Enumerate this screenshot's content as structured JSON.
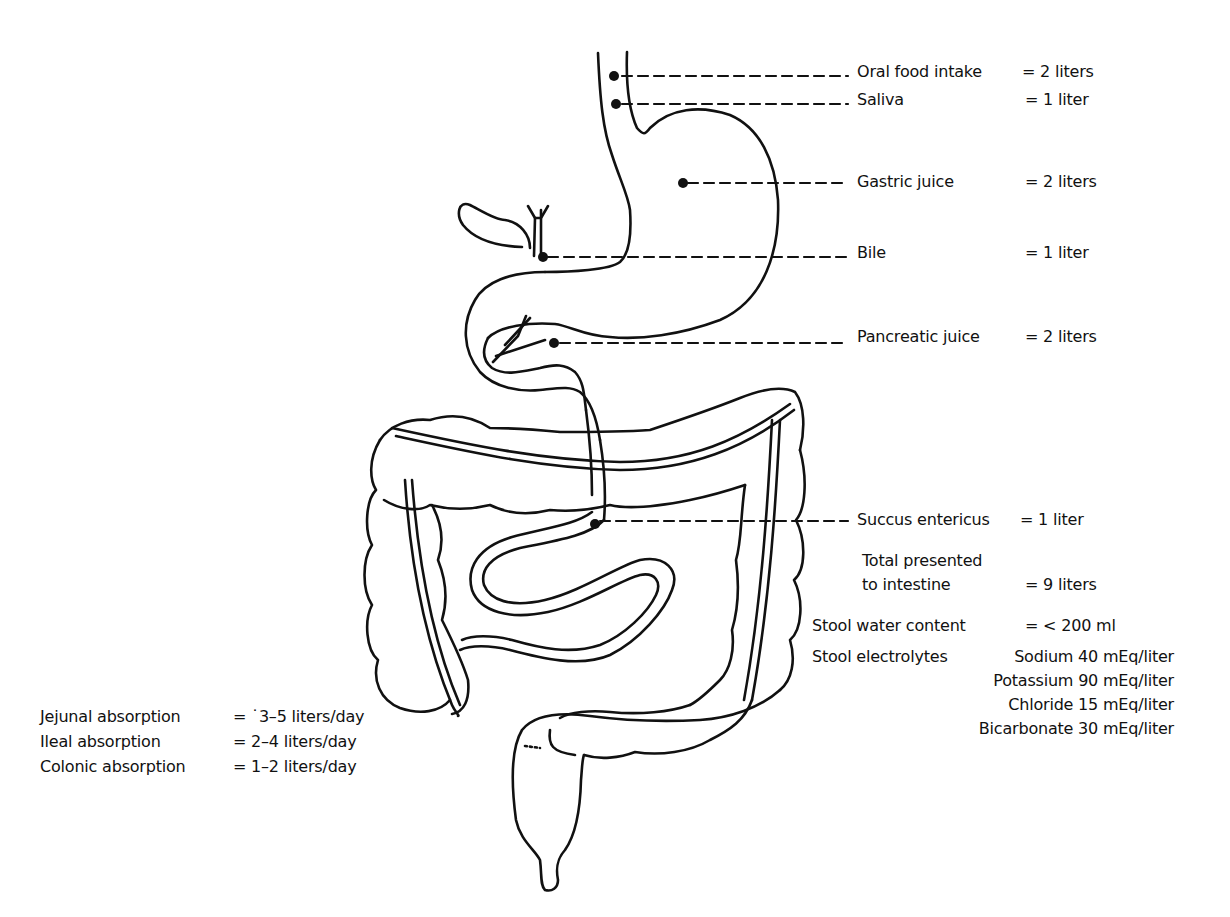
{
  "diagram": {
    "inputs": [
      {
        "name": "Oral food intake",
        "value": "= 2 liters"
      },
      {
        "name": "Saliva",
        "value": "= 1 liter"
      },
      {
        "name": "Gastric juice",
        "value": "= 2 liters"
      },
      {
        "name": "Bile",
        "value": "= 1 liter"
      },
      {
        "name": "Pancreatic juice",
        "value": "= 2 liters"
      },
      {
        "name": "Succus entericus",
        "value": "= 1 liter"
      }
    ],
    "total": {
      "line1": "Total presented",
      "line2": "to intestine",
      "value": "= 9 liters"
    },
    "stool_water": {
      "name": "Stool water content",
      "value": "= < 200 ml"
    },
    "stool_electrolytes": {
      "label": "Stool electrolytes",
      "items": [
        "Sodium 40 mEq/liter",
        "Potassium 90 mEq/liter",
        "Chloride 15 mEq/liter",
        "Bicarbonate 30 mEq/liter"
      ]
    },
    "absorption": [
      {
        "name": "Jejunal absorption",
        "value": "= ˙3–5 liters/day"
      },
      {
        "name": "Ileal absorption",
        "value": "= 2–4 liters/day"
      },
      {
        "name": "Colonic absorption",
        "value": "= 1–2 liters/day"
      }
    ]
  }
}
